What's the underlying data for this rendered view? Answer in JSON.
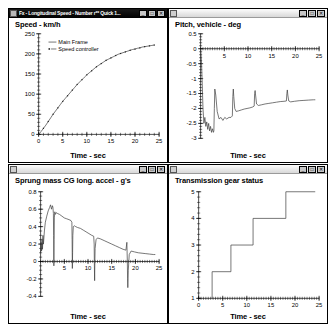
{
  "desktop": {
    "background": "#ffffff"
  },
  "windows": [
    {
      "id": "speed-window",
      "title": "Fx - Longitudinal Speed - Number r** Quick 1...",
      "active": true,
      "icon": "document-icon",
      "buttons": [
        {
          "name": "minimize-button",
          "glyph": "_"
        },
        {
          "name": "maximize-button",
          "glyph": "□"
        },
        {
          "name": "close-button",
          "glyph": "✕"
        }
      ]
    },
    {
      "id": "pitch-window",
      "title": "",
      "active": false,
      "icon": "document-icon",
      "buttons": [
        {
          "name": "minimize-button",
          "glyph": "_"
        },
        {
          "name": "maximize-button",
          "glyph": "□"
        },
        {
          "name": "close-button",
          "glyph": "✕"
        }
      ]
    },
    {
      "id": "accel-window",
      "title": "",
      "active": false,
      "icon": "document-icon",
      "buttons": [
        {
          "name": "minimize-button",
          "glyph": "_"
        },
        {
          "name": "maximize-button",
          "glyph": "□"
        },
        {
          "name": "close-button",
          "glyph": "✕"
        }
      ]
    },
    {
      "id": "gear-window",
      "title": "",
      "active": false,
      "icon": "document-icon",
      "buttons": [
        {
          "name": "minimize-button",
          "glyph": "_"
        },
        {
          "name": "maximize-button",
          "glyph": "□"
        },
        {
          "name": "close-button",
          "glyph": "✕"
        }
      ]
    }
  ],
  "chart_data": [
    {
      "id": "speed",
      "type": "line",
      "title": "Speed - km/h",
      "xlabel": "Time - sec",
      "ylabel": "",
      "xlim": [
        0,
        25
      ],
      "ylim": [
        0,
        250
      ],
      "xticks": [
        0,
        5,
        10,
        15,
        20,
        25
      ],
      "yticks": [
        0,
        50,
        100,
        150,
        200,
        250
      ],
      "xminor_step": 1,
      "yminor_step": 10,
      "grid": false,
      "legend_position": "upper-left",
      "legend": [
        "Main Frame",
        "Speed controller"
      ],
      "series": [
        {
          "name": "Main Frame",
          "style": "line",
          "x": [
            0,
            0.5,
            1,
            1.5,
            2,
            2.5,
            3,
            3.5,
            4,
            4.5,
            5,
            5.5,
            6,
            6.5,
            7,
            7.5,
            8,
            8.5,
            9,
            9.5,
            10,
            10.5,
            11,
            11.5,
            12,
            12.5,
            13,
            13.5,
            14,
            14.5,
            15,
            15.5,
            16,
            16.5,
            17,
            17.5,
            18,
            18.5,
            19,
            19.5,
            20,
            20.5,
            21,
            21.5,
            22,
            22.5,
            23,
            23.5,
            24
          ],
          "y": [
            0,
            7,
            15,
            23,
            32,
            41,
            50,
            58,
            66,
            74,
            82,
            89,
            96,
            103,
            110,
            117,
            124,
            130,
            136,
            142,
            148,
            153,
            158,
            163,
            168,
            172,
            176,
            180,
            184,
            187,
            190,
            193,
            196,
            199,
            201,
            203,
            205,
            207,
            209,
            211,
            212,
            214,
            215,
            217,
            218,
            219,
            220,
            221,
            222
          ]
        },
        {
          "name": "Speed controller",
          "style": "markers",
          "x": [
            0,
            1,
            2,
            3,
            4,
            5,
            6,
            7,
            8,
            9,
            10,
            11,
            12,
            13,
            14,
            15,
            16,
            17,
            18,
            19,
            20,
            21,
            22,
            23,
            24
          ],
          "y": [
            0,
            15,
            32,
            50,
            66,
            82,
            96,
            110,
            124,
            136,
            148,
            158,
            168,
            176,
            184,
            190,
            196,
            201,
            205,
            209,
            212,
            215,
            218,
            220,
            222
          ]
        }
      ]
    },
    {
      "id": "pitch",
      "type": "line",
      "title": "Pitch, vehicle - deg",
      "xlabel": "Time - sec",
      "ylabel": "",
      "xlim": [
        0,
        25
      ],
      "ylim": [
        -3,
        0.5
      ],
      "xticks": [
        5,
        10,
        15,
        20,
        25
      ],
      "yticks": [
        0.5,
        0,
        -0.5,
        -1,
        -1.5,
        -2,
        -2.5,
        -3
      ],
      "xminor_step": 0.5,
      "yminor_step": 0.1,
      "grid": false,
      "legend_position": "none",
      "legend": [],
      "series": [
        {
          "name": "Pitch, vehicle",
          "style": "line",
          "x": [
            0,
            0.2,
            0.35,
            0.5,
            0.7,
            0.9,
            1.1,
            1.3,
            1.5,
            1.7,
            1.9,
            2.1,
            2.3,
            2.5,
            2.7,
            2.8,
            2.9,
            3.0,
            3.2,
            3.5,
            3.9,
            4.3,
            4.7,
            5.1,
            5.5,
            6.0,
            6.4,
            6.7,
            6.8,
            6.9,
            7.0,
            7.2,
            7.5,
            8.0,
            8.6,
            9.2,
            9.8,
            10.4,
            11.0,
            11.3,
            11.4,
            11.5,
            11.6,
            11.8,
            12.2,
            12.8,
            13.6,
            14.4,
            15.2,
            16.0,
            16.8,
            17.6,
            18.1,
            18.2,
            18.3,
            18.4,
            18.6,
            19.0,
            19.8,
            20.8,
            21.8,
            22.8,
            23.8,
            24.2
          ],
          "y": [
            0,
            -0.5,
            -1.2,
            -2.0,
            -2.5,
            -2.3,
            -2.6,
            -2.45,
            -2.7,
            -2.5,
            -2.75,
            -2.6,
            -2.8,
            -2.68,
            -2.8,
            -2.75,
            -2.0,
            -1.35,
            -1.55,
            -2.1,
            -2.35,
            -2.3,
            -2.4,
            -2.3,
            -2.35,
            -2.3,
            -2.3,
            -2.25,
            -1.6,
            -1.35,
            -1.6,
            -2.0,
            -2.1,
            -2.08,
            -2.05,
            -2.02,
            -2.0,
            -1.98,
            -1.95,
            -1.92,
            -1.5,
            -1.4,
            -1.55,
            -1.85,
            -1.9,
            -1.88,
            -1.85,
            -1.83,
            -1.81,
            -1.79,
            -1.77,
            -1.76,
            -1.75,
            -1.5,
            -1.38,
            -1.55,
            -1.75,
            -1.78,
            -1.76,
            -1.74,
            -1.73,
            -1.72,
            -1.71,
            -1.71
          ]
        }
      ]
    },
    {
      "id": "accel",
      "type": "line",
      "title": "Sprung mass CG long. accel - g's",
      "xlabel": "Time - sec",
      "ylabel": "",
      "xlim": [
        0,
        25
      ],
      "ylim": [
        -0.4,
        0.8
      ],
      "xticks": [
        5,
        10,
        15,
        20,
        25
      ],
      "yticks": [
        0.8,
        0.6,
        0.4,
        0.2,
        0,
        -0.2,
        -0.4
      ],
      "xminor_step": 0.5,
      "yminor_step": 0.05,
      "grid": false,
      "legend_position": "none",
      "legend": [],
      "series": [
        {
          "name": "Sprung mass CG long. accel",
          "style": "line",
          "x": [
            0,
            0.1,
            0.2,
            0.3,
            0.4,
            0.5,
            0.6,
            0.8,
            1.0,
            1.3,
            1.6,
            1.9,
            2.1,
            2.3,
            2.5,
            2.6,
            2.7,
            2.75,
            2.8,
            2.85,
            2.9,
            3.0,
            3.1,
            3.3,
            3.6,
            4.0,
            4.5,
            5.0,
            5.5,
            6.0,
            6.4,
            6.6,
            6.65,
            6.7,
            6.75,
            6.8,
            6.9,
            7.1,
            7.4,
            7.8,
            8.4,
            9.0,
            9.6,
            10.2,
            10.8,
            11.2,
            11.3,
            11.35,
            11.4,
            11.45,
            11.5,
            11.7,
            12.0,
            12.6,
            13.4,
            14.2,
            15.0,
            15.8,
            16.6,
            17.4,
            18.0,
            18.2,
            18.3,
            18.35,
            18.4,
            18.5,
            18.7,
            19.1,
            19.8,
            20.6,
            21.4,
            22.2,
            23.0,
            23.8,
            24.2
          ],
          "y": [
            0.1,
            0.22,
            0.12,
            0.26,
            0.14,
            0.3,
            0.2,
            0.35,
            0.45,
            0.52,
            0.58,
            0.62,
            0.65,
            0.6,
            0.64,
            0.62,
            0.55,
            0.3,
            -0.05,
            0.25,
            0.5,
            0.57,
            0.54,
            0.56,
            0.55,
            0.54,
            0.52,
            0.5,
            0.49,
            0.48,
            0.47,
            0.45,
            0.25,
            -0.08,
            0.1,
            0.3,
            0.4,
            0.41,
            0.4,
            0.39,
            0.38,
            0.36,
            0.34,
            0.32,
            0.3,
            0.29,
            0.2,
            -0.05,
            -0.22,
            0.0,
            0.15,
            0.25,
            0.27,
            0.26,
            0.24,
            0.22,
            0.2,
            0.18,
            0.16,
            0.14,
            0.13,
            0.22,
            0.0,
            -0.2,
            -0.3,
            -0.1,
            0.08,
            0.12,
            0.11,
            0.1,
            0.095,
            0.09,
            0.085,
            0.08,
            0.08
          ]
        }
      ]
    },
    {
      "id": "gear",
      "type": "line",
      "title": "Transmission gear status",
      "xlabel": "Time - sec",
      "ylabel": "",
      "xlim": [
        0,
        25
      ],
      "ylim": [
        1,
        5
      ],
      "xticks": [
        0,
        5,
        10,
        15,
        20,
        25
      ],
      "yticks": [
        1,
        2,
        3,
        4,
        5
      ],
      "xminor_step": 0.5,
      "yminor_step": 0.2,
      "grid": false,
      "legend_position": "none",
      "legend": [],
      "shift_times": [
        2.8,
        6.7,
        11.3,
        18.1
      ],
      "series": [
        {
          "name": "Transmission gear status",
          "style": "step",
          "x": [
            2.8,
            2.8,
            6.7,
            6.7,
            11.3,
            11.3,
            18.1,
            18.1,
            24.2
          ],
          "y": [
            1,
            2,
            2,
            3,
            3,
            4,
            4,
            5,
            5
          ]
        }
      ]
    }
  ]
}
